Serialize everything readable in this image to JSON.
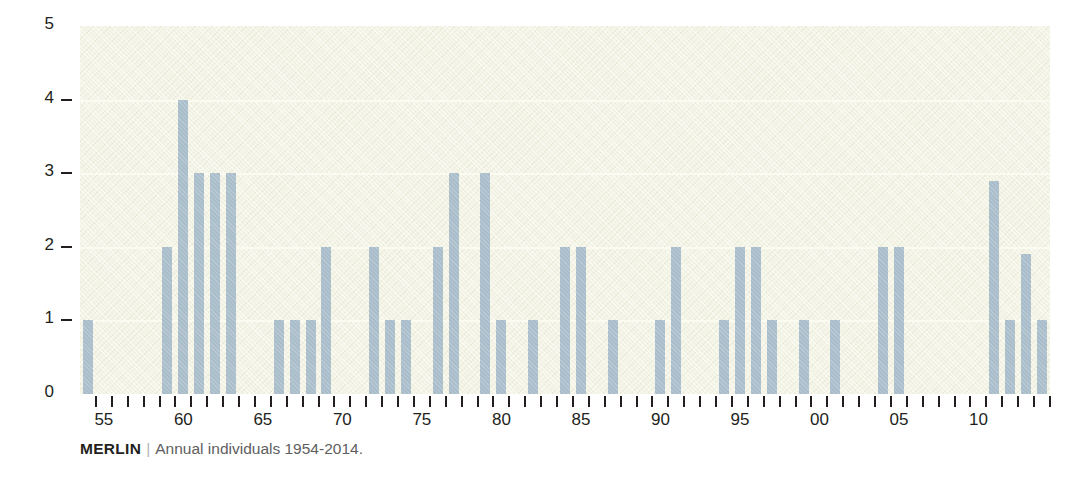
{
  "chart_data": {
    "type": "bar",
    "title": "",
    "subtitle": "",
    "xlabel": "",
    "ylabel": "",
    "ylim": [
      0,
      5
    ],
    "yticks": [
      0,
      1,
      2,
      3,
      4,
      5
    ],
    "ytick_labels": [
      "0",
      "1",
      "2",
      "3",
      "4",
      "5"
    ],
    "grid": true,
    "legend": null,
    "x_range": [
      1954,
      2014
    ],
    "x_tick_labels": [
      {
        "year": 1955,
        "label": "55"
      },
      {
        "year": 1960,
        "label": "60"
      },
      {
        "year": 1965,
        "label": "65"
      },
      {
        "year": 1970,
        "label": "70"
      },
      {
        "year": 1975,
        "label": "75"
      },
      {
        "year": 1980,
        "label": "80"
      },
      {
        "year": 1985,
        "label": "85"
      },
      {
        "year": 1990,
        "label": "90"
      },
      {
        "year": 1995,
        "label": "95"
      },
      {
        "year": 2000,
        "label": "00"
      },
      {
        "year": 2005,
        "label": "05"
      },
      {
        "year": 2010,
        "label": "10"
      }
    ],
    "categories": [
      1954,
      1955,
      1956,
      1957,
      1958,
      1959,
      1960,
      1961,
      1962,
      1963,
      1964,
      1965,
      1966,
      1967,
      1968,
      1969,
      1970,
      1971,
      1972,
      1973,
      1974,
      1975,
      1976,
      1977,
      1978,
      1979,
      1980,
      1981,
      1982,
      1983,
      1984,
      1985,
      1986,
      1987,
      1988,
      1989,
      1990,
      1991,
      1992,
      1993,
      1994,
      1995,
      1996,
      1997,
      1998,
      1999,
      2000,
      2001,
      2002,
      2003,
      2004,
      2005,
      2006,
      2007,
      2008,
      2009,
      2010,
      2011,
      2012,
      2013,
      2014
    ],
    "values": [
      1,
      0,
      0,
      0,
      0,
      2,
      4,
      3,
      3,
      3,
      0,
      0,
      1,
      1,
      1,
      2,
      0,
      0,
      2,
      1,
      1,
      0,
      2,
      3,
      0,
      3,
      1,
      0,
      1,
      0,
      2,
      2,
      0,
      1,
      0,
      0,
      1,
      2,
      0,
      0,
      1,
      2,
      2,
      1,
      0,
      1,
      0,
      1,
      0,
      0,
      2,
      2,
      0,
      0,
      0,
      0,
      0,
      2.9,
      1,
      1.9,
      1
    ],
    "colors": {
      "bar": "#a9bdcb",
      "plot_background": "#f4f4e6",
      "gridline": "#fbfbf2",
      "axis_text": "#231f20",
      "caption_text": "#6e6e6e"
    }
  },
  "caption": {
    "source": "MERLIN",
    "separator": "|",
    "description": "Annual individuals 1954-2014."
  }
}
